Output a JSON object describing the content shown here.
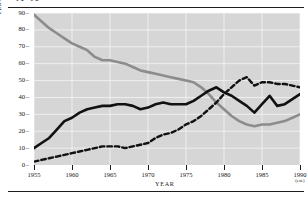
{
  "figure": {
    "clipped_header_text": "A  A",
    "axis_labels": {
      "y": "PERCENTAGE OF MARKET SHARE",
      "x": "YEAR"
    }
  },
  "chart_data": {
    "type": "line",
    "title": "",
    "xlabel": "YEAR",
    "ylabel": "PERCENTAGE OF MARKET SHARE",
    "xlim": [
      1955,
      1990
    ],
    "ylim": [
      0,
      90
    ],
    "xticks": [
      "1955",
      "1960",
      "1965",
      "1970",
      "1975",
      "1980",
      "1985",
      "1990"
    ],
    "xtick_note": "(est.)",
    "yticks": [
      "0",
      "10",
      "20",
      "30",
      "40",
      "50",
      "60",
      "70",
      "80",
      "90"
    ],
    "grid": true,
    "grid_color": "#f2f2f2",
    "plot_background": "#d6d6d6",
    "legend": "none",
    "x": [
      1955,
      1956,
      1957,
      1958,
      1959,
      1960,
      1961,
      1962,
      1963,
      1964,
      1965,
      1966,
      1967,
      1968,
      1969,
      1970,
      1971,
      1972,
      1973,
      1974,
      1975,
      1976,
      1977,
      1978,
      1979,
      1980,
      1981,
      1982,
      1983,
      1984,
      1985,
      1986,
      1987,
      1988,
      1989,
      1990
    ],
    "series": [
      {
        "name": "declining-gray-series",
        "style": "solid",
        "color": "#8c8c8c",
        "width": 2.6,
        "values": [
          89,
          85,
          81,
          78,
          75,
          72,
          70,
          68,
          64,
          62,
          62,
          61,
          60,
          58,
          56,
          55,
          54,
          53,
          52,
          51,
          50,
          49,
          46,
          42,
          37,
          33,
          29,
          26,
          24,
          23,
          24,
          24,
          25,
          26,
          28,
          30
        ]
      },
      {
        "name": "rising-black-series",
        "style": "solid",
        "color": "#111111",
        "width": 2.6,
        "values": [
          10,
          13,
          16,
          21,
          26,
          28,
          31,
          33,
          34,
          35,
          35,
          36,
          36,
          35,
          33,
          34,
          36,
          37,
          36,
          36,
          36,
          38,
          41,
          44,
          46,
          43,
          41,
          38,
          35,
          31,
          36,
          41,
          35,
          36,
          39,
          42
        ]
      },
      {
        "name": "rising-dashed-series",
        "style": "dashed",
        "color": "#111111",
        "width": 2.4,
        "values": [
          2,
          3,
          4,
          5,
          6,
          7,
          8,
          9,
          10,
          11,
          11,
          11,
          10,
          11,
          12,
          13,
          16,
          18,
          19,
          21,
          24,
          26,
          29,
          33,
          37,
          42,
          46,
          50,
          52,
          47,
          49,
          49,
          48,
          48,
          47,
          46
        ]
      }
    ]
  }
}
